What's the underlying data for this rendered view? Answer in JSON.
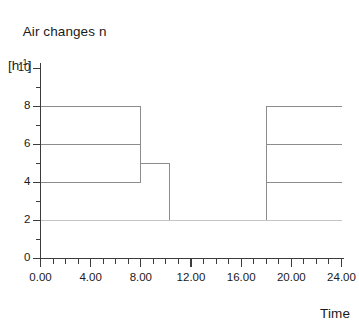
{
  "chart_data": {
    "type": "line",
    "title": "Air changes n",
    "ylabel": "Air changes n",
    "yunit": "[h-1]",
    "yunit_base": "[h",
    "yunit_sup": "-1",
    "yunit_close": "]",
    "xlabel": "Time",
    "xlim": [
      0,
      24
    ],
    "ylim": [
      0,
      10
    ],
    "xticks": [
      0,
      4,
      8,
      12,
      16,
      20,
      24
    ],
    "xtick_labels": [
      "0.00",
      "4.00",
      "8.00",
      "12.00",
      "16.00",
      "20.00",
      "24.00"
    ],
    "xminor_step": 1,
    "yticks": [
      0,
      2,
      4,
      6,
      8,
      10
    ],
    "ytick_labels": [
      "0",
      "2",
      "4",
      "6",
      "8",
      "10"
    ],
    "yminor_step": 1,
    "grid": false,
    "legend": "none",
    "step_type": "post",
    "series": [
      {
        "name": "schedule-8",
        "color": "#8c8c8c",
        "width": 1,
        "x": [
          0,
          8,
          10.3,
          18,
          24
        ],
        "y": [
          8,
          5,
          2,
          8,
          8
        ]
      },
      {
        "name": "schedule-6",
        "color": "#8c8c8c",
        "width": 1,
        "x": [
          0,
          8,
          10.3,
          18,
          24
        ],
        "y": [
          6,
          5,
          2,
          6,
          6
        ]
      },
      {
        "name": "schedule-4",
        "color": "#8c8c8c",
        "width": 1,
        "x": [
          0,
          8,
          10.3,
          18,
          24
        ],
        "y": [
          4,
          5,
          2,
          4,
          4
        ]
      },
      {
        "name": "baseline-2",
        "color": "#c4c4c4",
        "width": 1,
        "x": [
          0,
          24
        ],
        "y": [
          2,
          2
        ]
      }
    ],
    "axis_color": "#3c3c3c",
    "plot_bg": "#ffffff"
  },
  "figure": {
    "name": "air-changes-schedule-chart"
  }
}
